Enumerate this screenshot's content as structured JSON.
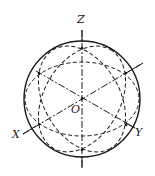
{
  "diagram": {
    "type": "sphere-axonometric-projection",
    "labels": {
      "z_axis": "Z",
      "x_axis": "X",
      "y_axis": "Y",
      "origin": "O"
    },
    "colors": {
      "stroke": "#1a1a1a",
      "background": "#ffffff"
    },
    "sphere": {
      "cx": 82,
      "cy": 99,
      "r": 58
    }
  }
}
